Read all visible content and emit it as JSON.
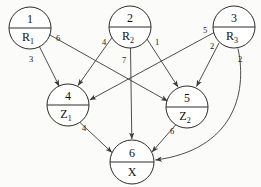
{
  "diagram": {
    "colors": {
      "background": "#fbfbf9",
      "node_stroke": "#2c2c2c",
      "node_fill": "#ffffff",
      "edge_stroke": "#3a3a3a",
      "text": "#111111"
    }
  },
  "nodes": [
    {
      "id": "n1",
      "number": "1",
      "name": "R",
      "subscript": "1",
      "cx": 30,
      "cy": 28,
      "r": 21
    },
    {
      "id": "n2",
      "number": "2",
      "name": "R",
      "subscript": "2",
      "cx": 130,
      "cy": 27,
      "r": 21
    },
    {
      "id": "n3",
      "number": "3",
      "name": "R",
      "subscript": "3",
      "cx": 234,
      "cy": 27,
      "r": 21
    },
    {
      "id": "n4",
      "number": "4",
      "name": "Z",
      "subscript": "1",
      "cx": 68,
      "cy": 105,
      "r": 21
    },
    {
      "id": "n5",
      "number": "5",
      "name": "Z",
      "subscript": "2",
      "cx": 187,
      "cy": 107,
      "r": 21
    },
    {
      "id": "n6",
      "number": "6",
      "name": "X",
      "subscript": "",
      "cx": 132,
      "cy": 162,
      "r": 22
    }
  ],
  "edges": [
    {
      "id": "e1",
      "from": "n1",
      "to": "n4",
      "weight": "3",
      "label_x": 31,
      "label_y": 62
    },
    {
      "id": "e2",
      "from": "n1",
      "to": "n5",
      "weight": "6",
      "label_x": 58,
      "label_y": 41
    },
    {
      "id": "e3",
      "from": "n2",
      "to": "n4",
      "weight": "4",
      "label_x": 104,
      "label_y": 45
    },
    {
      "id": "e4",
      "from": "n2",
      "to": "n5",
      "weight": "1",
      "label_x": 157,
      "label_y": 45
    },
    {
      "id": "e5",
      "from": "n2",
      "to": "n6",
      "weight": "7",
      "label_x": 124,
      "label_y": 63
    },
    {
      "id": "e6",
      "from": "n3",
      "to": "n4",
      "weight": "5",
      "label_x": 205,
      "label_y": 33
    },
    {
      "id": "e7",
      "from": "n3",
      "to": "n5",
      "weight": "2",
      "label_x": 212,
      "label_y": 49
    },
    {
      "id": "e8",
      "from": "n3",
      "to": "n6",
      "weight": "2",
      "label_x": 240,
      "label_y": 62
    },
    {
      "id": "e9",
      "from": "n4",
      "to": "n6",
      "weight": "4",
      "label_x": 84,
      "label_y": 131
    },
    {
      "id": "e10",
      "from": "n5",
      "to": "n6",
      "weight": "6",
      "label_x": 172,
      "label_y": 134
    }
  ]
}
